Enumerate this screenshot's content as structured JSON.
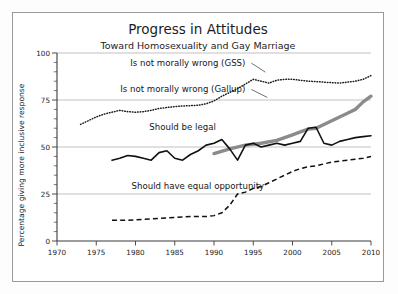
{
  "chart_data": {
    "type": "line",
    "title": "Progress in Attitudes",
    "subtitle": "Toward Homosexuality and Gay Marriage",
    "xlabel": "",
    "ylabel": "Percentage giving more inclusive response",
    "xlim": [
      1970,
      2010
    ],
    "ylim": [
      0,
      100
    ],
    "xticks": [
      1970,
      1975,
      1980,
      1985,
      1990,
      1995,
      2000,
      2005,
      2010
    ],
    "yticks": [
      0,
      25,
      50,
      75,
      100
    ],
    "xtick_labels": [
      "1970",
      "1975",
      "1980",
      "1985",
      "1990",
      "1995",
      "2000",
      "2005",
      "2010"
    ],
    "ytick_labels": [
      "0",
      "25",
      "50",
      "75",
      "100"
    ],
    "grid": "horizontal",
    "legend_position": "inline-annotations",
    "minor_ticks_y": 5,
    "series": [
      {
        "name": "Is not morally wrong (GSS)",
        "style": "dotted",
        "color": "#1b1b1b",
        "label_x": 1994.0,
        "label_y": 93.0,
        "points": [
          [
            1973,
            62
          ],
          [
            1974,
            64
          ],
          [
            1975,
            66
          ],
          [
            1976,
            67.5
          ],
          [
            1977,
            68.5
          ],
          [
            1978,
            69.5
          ],
          [
            1979,
            68.8
          ],
          [
            1980,
            68.5
          ],
          [
            1981,
            68.8
          ],
          [
            1982,
            69.5
          ],
          [
            1983,
            70.5
          ],
          [
            1984,
            71
          ],
          [
            1985,
            71.5
          ],
          [
            1986,
            71.8
          ],
          [
            1987,
            72
          ],
          [
            1988,
            72.2
          ],
          [
            1989,
            73
          ],
          [
            1990,
            74.5
          ],
          [
            1991,
            77
          ],
          [
            1992,
            79
          ],
          [
            1993,
            81
          ],
          [
            1994,
            83.5
          ],
          [
            1995,
            86
          ],
          [
            1996,
            85
          ],
          [
            1997,
            84
          ],
          [
            1998,
            85.5
          ],
          [
            1999,
            86
          ],
          [
            2000,
            86
          ],
          [
            2001,
            85.5
          ],
          [
            2002,
            85
          ],
          [
            2003,
            84.8
          ],
          [
            2004,
            84.5
          ],
          [
            2005,
            84.2
          ],
          [
            2006,
            84
          ],
          [
            2007,
            84.5
          ],
          [
            2008,
            85
          ],
          [
            2009,
            86
          ],
          [
            2010,
            88
          ]
        ]
      },
      {
        "name": "Is not morally wrong (Gallup)",
        "style": "thick-solid-gray",
        "color": "#8b8b8b",
        "label_x": 1994.0,
        "label_y": 79.0,
        "points": [
          [
            1990,
            46.5
          ],
          [
            1992,
            49
          ],
          [
            1994,
            51
          ],
          [
            1996,
            52
          ],
          [
            1998,
            53.5
          ],
          [
            1999,
            55
          ],
          [
            2000,
            56.5
          ],
          [
            2001,
            58
          ],
          [
            2002,
            59.5
          ],
          [
            2003,
            60
          ],
          [
            2004,
            62
          ],
          [
            2005,
            64
          ],
          [
            2006,
            66
          ],
          [
            2007,
            68
          ],
          [
            2008,
            70
          ],
          [
            2009,
            74
          ],
          [
            2010,
            77
          ]
        ]
      },
      {
        "name": "Should be legal",
        "style": "solid",
        "color": "#111111",
        "label_x": 1986.0,
        "label_y": 59.0,
        "points": [
          [
            1977,
            43
          ],
          [
            1978,
            44
          ],
          [
            1979,
            45.5
          ],
          [
            1980,
            45
          ],
          [
            1981,
            44
          ],
          [
            1982,
            43
          ],
          [
            1983,
            47
          ],
          [
            1984,
            48
          ],
          [
            1985,
            44
          ],
          [
            1986,
            43
          ],
          [
            1987,
            46
          ],
          [
            1988,
            48
          ],
          [
            1989,
            51
          ],
          [
            1990,
            52
          ],
          [
            1991,
            54
          ],
          [
            1992,
            49
          ],
          [
            1993,
            43
          ],
          [
            1994,
            51
          ],
          [
            1995,
            52
          ],
          [
            1996,
            50
          ],
          [
            1997,
            51
          ],
          [
            1998,
            52
          ],
          [
            1999,
            51
          ],
          [
            2000,
            52
          ],
          [
            2001,
            53
          ],
          [
            2002,
            60
          ],
          [
            2003,
            60.5
          ],
          [
            2004,
            52
          ],
          [
            2005,
            51
          ],
          [
            2006,
            53
          ],
          [
            2007,
            54
          ],
          [
            2008,
            55
          ],
          [
            2009,
            55.5
          ],
          [
            2010,
            56
          ]
        ]
      },
      {
        "name": "Should have equal opportunity",
        "style": "dashed",
        "color": "#111111",
        "label_x": 1979.5,
        "label_y": 27.5,
        "points": [
          [
            1977,
            11
          ],
          [
            1979,
            11
          ],
          [
            1981,
            11.5
          ],
          [
            1983,
            12
          ],
          [
            1985,
            12.5
          ],
          [
            1987,
            13
          ],
          [
            1989,
            13
          ],
          [
            1990,
            13.5
          ],
          [
            1991,
            15
          ],
          [
            1992,
            19
          ],
          [
            1993,
            25
          ],
          [
            1994,
            26
          ],
          [
            1995,
            28
          ],
          [
            1996,
            29
          ],
          [
            1997,
            31
          ],
          [
            1998,
            33
          ],
          [
            1999,
            35
          ],
          [
            2000,
            37
          ],
          [
            2001,
            38.5
          ],
          [
            2002,
            39.5
          ],
          [
            2003,
            40
          ],
          [
            2004,
            41
          ],
          [
            2005,
            42
          ],
          [
            2006,
            42.5
          ],
          [
            2007,
            43
          ],
          [
            2008,
            43.5
          ],
          [
            2009,
            44
          ],
          [
            2010,
            45
          ]
        ]
      }
    ]
  }
}
